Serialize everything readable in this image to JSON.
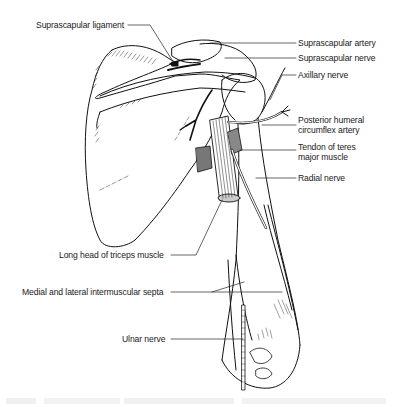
{
  "diagram": {
    "labels": [
      {
        "id": "suprascapular-ligament",
        "text": "Suprascapular ligament"
      },
      {
        "id": "suprascapular-artery",
        "text": "Suprascapular artery"
      },
      {
        "id": "suprascapular-nerve",
        "text": "Suprascapular nerve"
      },
      {
        "id": "axillary-nerve",
        "text": "Axillary nerve"
      },
      {
        "id": "posterior-humeral-circumflex-artery",
        "text": "Posterior humeral\ncircumflex artery",
        "line1": "Posterior humeral",
        "line2": "circumflex artery"
      },
      {
        "id": "tendon-teres-major",
        "text": "Tendon of teres\nmajor muscle",
        "line1": "Tendon of teres",
        "line2": "major muscle"
      },
      {
        "id": "radial-nerve",
        "text": "Radial nerve"
      },
      {
        "id": "long-head-triceps",
        "text": "Long head of triceps muscle"
      },
      {
        "id": "intermuscular-septa",
        "text": "Medial and lateral intermuscular septa"
      },
      {
        "id": "ulnar-nerve",
        "text": "Ulnar nerve"
      }
    ]
  }
}
